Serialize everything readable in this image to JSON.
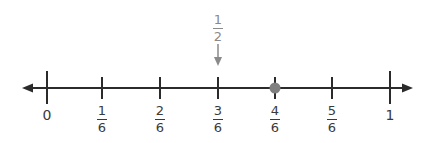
{
  "number_line": {
    "min": 0,
    "max": 1,
    "denominator": 6,
    "ticks": [
      {
        "value": "0",
        "kind": "whole",
        "x": 47
      },
      {
        "num": "1",
        "den": "6",
        "kind": "fraction",
        "x": 102
      },
      {
        "num": "2",
        "den": "6",
        "kind": "fraction",
        "x": 160
      },
      {
        "num": "3",
        "den": "6",
        "kind": "fraction",
        "x": 218
      },
      {
        "num": "4",
        "den": "6",
        "kind": "fraction",
        "x": 275
      },
      {
        "num": "5",
        "den": "6",
        "kind": "fraction",
        "x": 332
      },
      {
        "value": "1",
        "kind": "whole",
        "x": 390
      }
    ],
    "point": {
      "label": "4/6",
      "x": 275,
      "color": "#808080"
    },
    "marker": {
      "num": "1",
      "den": "2",
      "points_to": "3/6",
      "x": 218,
      "color": "#8a8a8a"
    },
    "line_color": "#2b2b2b"
  }
}
